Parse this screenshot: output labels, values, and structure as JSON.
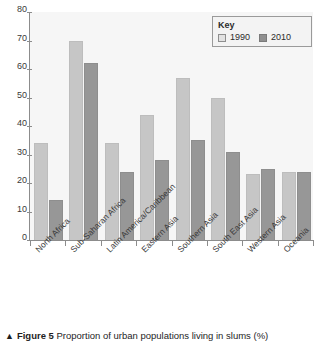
{
  "chart_data": {
    "type": "bar",
    "title": "",
    "xlabel": "",
    "ylabel": "",
    "ylim": [
      0,
      80
    ],
    "yticks": [
      0,
      10,
      20,
      30,
      40,
      50,
      60,
      70,
      80
    ],
    "grid": false,
    "legend_position": "top-right",
    "categories": [
      "North Africa",
      "Sub-Saharan Africa",
      "Latin America/Caribbean",
      "Eastern Asia",
      "Southern Asia",
      "South East Asia",
      "Western Asia",
      "Oceania"
    ],
    "series": [
      {
        "name": "1990",
        "color": "#c6c6c6",
        "values": [
          34,
          70,
          34,
          44,
          57,
          50,
          23,
          24
        ]
      },
      {
        "name": "2010",
        "color": "#979797",
        "values": [
          14,
          62,
          24,
          28,
          35,
          31,
          25,
          24
        ]
      }
    ]
  },
  "legend": {
    "title": "Key",
    "entries": [
      {
        "label": "1990",
        "swatch": "legend-swatch-1990"
      },
      {
        "label": "2010",
        "swatch": "legend-swatch-2010"
      }
    ]
  },
  "caption": {
    "marker": "▲",
    "figure_number": "Figure 5",
    "text": " Proportion of urban populations living in slums (%)"
  }
}
